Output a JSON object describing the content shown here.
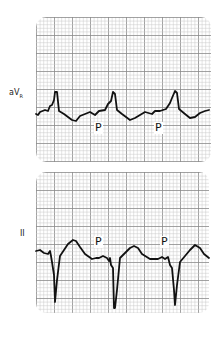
{
  "figure": {
    "leads": [
      {
        "name": "aVR",
        "label_main": "aV",
        "label_sub": "R",
        "grid": {
          "x": 36,
          "y": 17,
          "width": 175,
          "height": 145
        },
        "label_pos": {
          "x": 9,
          "y": 88
        },
        "p_labels": [
          {
            "text": "P",
            "x": 94,
            "y": 122
          },
          {
            "text": "P",
            "x": 154,
            "y": 122
          }
        ],
        "trace": "36,114 38,115 40,112 45,110 48,111 50,106 52,105 54,100 55,92 57,92 59,111 64,114 68,117 72,120 76,121 80,116 90,112 95,115 99,111 105,110 108,104 111,101 113,92 115,94 117,110 122,114 126,117 130,120 135,118 145,112 152,114 155,111 160,111 166,109 170,103 172,98 175,91 177,93 179,109 185,114 190,118 195,117 200,113 205,111 209,110"
      },
      {
        "name": "II",
        "label_main": "II",
        "label_sub": "",
        "grid": {
          "x": 36,
          "y": 172,
          "width": 173,
          "height": 141
        },
        "label_pos": {
          "x": 20,
          "y": 229
        },
        "p_labels": [
          {
            "text": "P",
            "x": 94,
            "y": 236
          },
          {
            "text": "P",
            "x": 160,
            "y": 236
          }
        ],
        "trace": "36,251 40,250 44,253 48,254 50,251 51,256 52,262 54,275 55,302 57,280 60,256 64,250 68,244 73,240 76,241 80,247 85,254 92,259 96,258 99,258 103,256 107,258 109,261 110,258 111,265 113,268 114,308 115,308 117,290 120,258 125,253 130,248 134,246 138,248 142,254 150,259 158,259 162,257 165,259 168,257 170,265 172,268 174,290 175,305 177,285 180,262 185,256 190,250 195,245 200,248 204,254 209,258"
      }
    ],
    "colors": {
      "background": "#ffffff",
      "grid_minor": "#c8c8c8",
      "grid_major": "#8a8a8a",
      "trace": "#111111",
      "text": "#222222"
    },
    "grid_spacing": {
      "minor": 3.6,
      "major": 18
    }
  }
}
